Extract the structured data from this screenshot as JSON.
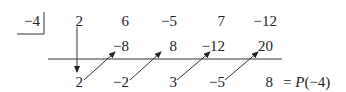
{
  "divisor": "−4",
  "coefficients": [
    "2",
    "6",
    "−5",
    "7",
    "−12"
  ],
  "products": [
    "−8",
    "8",
    "−12",
    "20"
  ],
  "results": [
    "2",
    "−2",
    "3",
    "−5",
    "8"
  ],
  "remainder_label_eq": "=",
  "remainder_label_fn": "P",
  "remainder_label_arg": "(−4)"
}
